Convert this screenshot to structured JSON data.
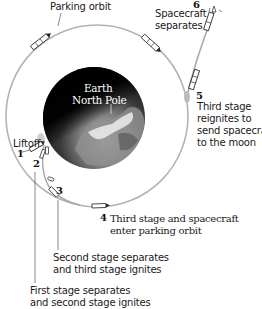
{
  "diagram": {
    "orbit_label": "Parking orbit",
    "earth_label_line1": "Earth",
    "earth_label_line2": "North Pole",
    "steps": [
      {
        "number": "1",
        "label": "Liftoff"
      },
      {
        "number": "2",
        "label_line1": "First stage separates",
        "label_line2": "and second stage ignites"
      },
      {
        "number": "3",
        "label_line1": "Second stage separates",
        "label_line2": "and third stage ignites"
      },
      {
        "number": "4",
        "label_line1": "Third stage and spacecraft",
        "label_line2": "enter parking orbit"
      },
      {
        "number": "5",
        "label_line1": "Third stage",
        "label_line2": "reignites to",
        "label_line3": "send spacecraft",
        "label_line4": "to the moon"
      },
      {
        "number": "6",
        "label_line1": "Spacecraft",
        "label_line2": "separates"
      }
    ],
    "colors": {
      "orbit": "#b0b0b0",
      "earth_dark": "#0d0d0d",
      "earth_land": "#9a9a9a",
      "text": "#1a1a1a"
    }
  }
}
